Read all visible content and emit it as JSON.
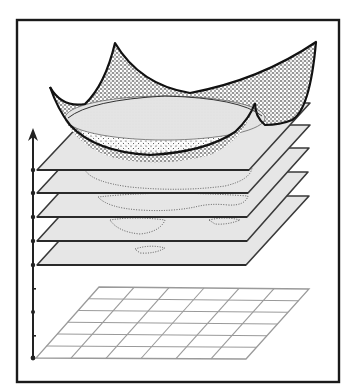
{
  "figure": {
    "colors": {
      "frame": "#1a1a1a",
      "plane_fill": "#e6e6e6",
      "plane_stroke": "#3a3a3a",
      "grid_stroke": "#9a9a9a",
      "surface_stipple": "#111111",
      "inner_ellipse": "#dcdcdc"
    },
    "vertical_axis": {
      "direction": "up",
      "arrow": "arrow-up-icon",
      "tick_count": 9
    },
    "level_planes": {
      "count": 5
    },
    "base_grid": {
      "columns": 6,
      "rows": 6
    },
    "surface": {
      "peaks": 4,
      "stipple_shading": true
    }
  }
}
